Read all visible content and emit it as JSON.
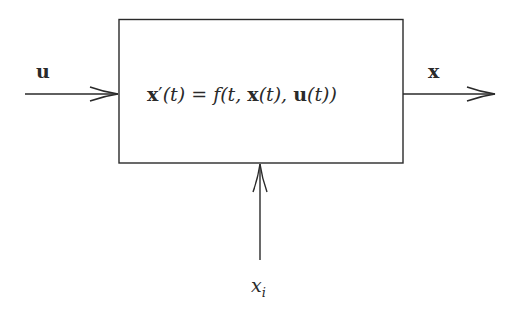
{
  "diagram": {
    "type": "block-diagram",
    "block": {
      "equation_parts": {
        "lhs": "x",
        "prime": "′",
        "lhs_arg": "(t)",
        "eq": " = ",
        "f": "f",
        "open": "(t, ",
        "x": "x",
        "x_arg": "(t), ",
        "u": "u",
        "u_arg": "(t))"
      }
    },
    "input": {
      "label": "u"
    },
    "output": {
      "label": "x"
    },
    "initial": {
      "label_base": "x",
      "label_sub": "i"
    },
    "stroke_color": "#2a2a2a"
  }
}
